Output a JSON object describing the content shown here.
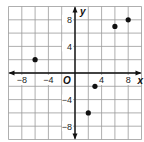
{
  "chart_data": {
    "type": "scatter",
    "title": "",
    "xlabel": "x",
    "ylabel": "y",
    "origin_label": "O",
    "xlim": [
      -10,
      10
    ],
    "ylim": [
      -10,
      10
    ],
    "grid": true,
    "grid_step": 2,
    "x_ticks": [
      {
        "value": -8,
        "label": "−8"
      },
      {
        "value": -4,
        "label": "−4"
      },
      {
        "value": 4,
        "label": "4"
      },
      {
        "value": 8,
        "label": "8"
      }
    ],
    "y_ticks": [
      {
        "value": 8,
        "label": "8"
      },
      {
        "value": 4,
        "label": "4"
      },
      {
        "value": -4,
        "label": "−4"
      },
      {
        "value": -8,
        "label": "−8"
      }
    ],
    "points": [
      {
        "x": -6,
        "y": 2
      },
      {
        "x": 2,
        "y": -6
      },
      {
        "x": 3,
        "y": -2
      },
      {
        "x": 6,
        "y": 7
      },
      {
        "x": 8,
        "y": 8
      }
    ],
    "colors": {
      "grid": "#9a9a9a",
      "axis": "#111111",
      "point": "#111111"
    }
  }
}
